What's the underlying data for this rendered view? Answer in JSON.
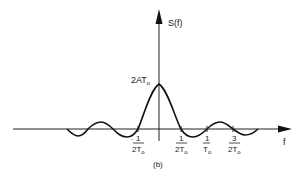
{
  "figure": {
    "caption": "(b)",
    "y_axis_label": "S(f)",
    "x_axis_label": "f",
    "peak_label": {
      "prefix": "2AT",
      "sub": "o"
    },
    "ticks": [
      {
        "id": "neg_half",
        "num": "1",
        "den": "2T",
        "sub": "o",
        "sign": "-"
      },
      {
        "id": "pos_half",
        "num": "1",
        "den": "2T",
        "sub": "o",
        "sign": ""
      },
      {
        "id": "one",
        "num": "1",
        "den": "T",
        "sub": "o",
        "sign": ""
      },
      {
        "id": "three_half",
        "num": "3",
        "den": "2T",
        "sub": "o",
        "sign": ""
      }
    ]
  },
  "colors": {
    "ink": "#1a1a1a",
    "background": "#ffffff"
  }
}
